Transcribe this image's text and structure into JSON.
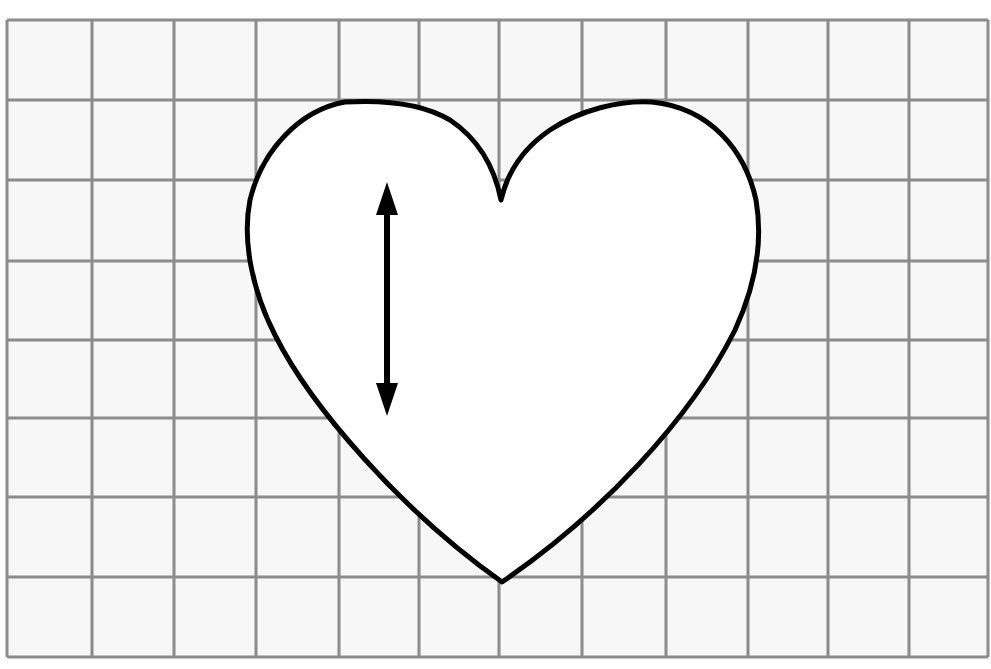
{
  "diagram": {
    "type": "grid-with-heart-shape",
    "grid": {
      "columns": 12,
      "rows": 8,
      "vertical_lines_x": [
        7,
        92,
        174,
        256,
        339,
        419,
        499,
        582,
        666,
        748,
        828,
        909,
        988
      ],
      "horizontal_lines_y": [
        20,
        100,
        180,
        261,
        340,
        418,
        497,
        577,
        657
      ],
      "line_color": "#8c8c8c",
      "background_color": "#f7f7f7"
    },
    "heart": {
      "outline_color": "#000000",
      "fill_color": "#ffffff",
      "top_cusp": [
        501,
        200
      ],
      "bottom_point": [
        502,
        582
      ],
      "left_lobe_top": [
        345,
        102
      ],
      "right_lobe_top": [
        652,
        102
      ],
      "leftmost": [
        247,
        240
      ],
      "rightmost": [
        760,
        240
      ]
    },
    "arrow": {
      "type": "double-headed-vertical-arrow",
      "x": 387,
      "y_top": 182,
      "y_bottom": 416,
      "color": "#000000"
    }
  }
}
